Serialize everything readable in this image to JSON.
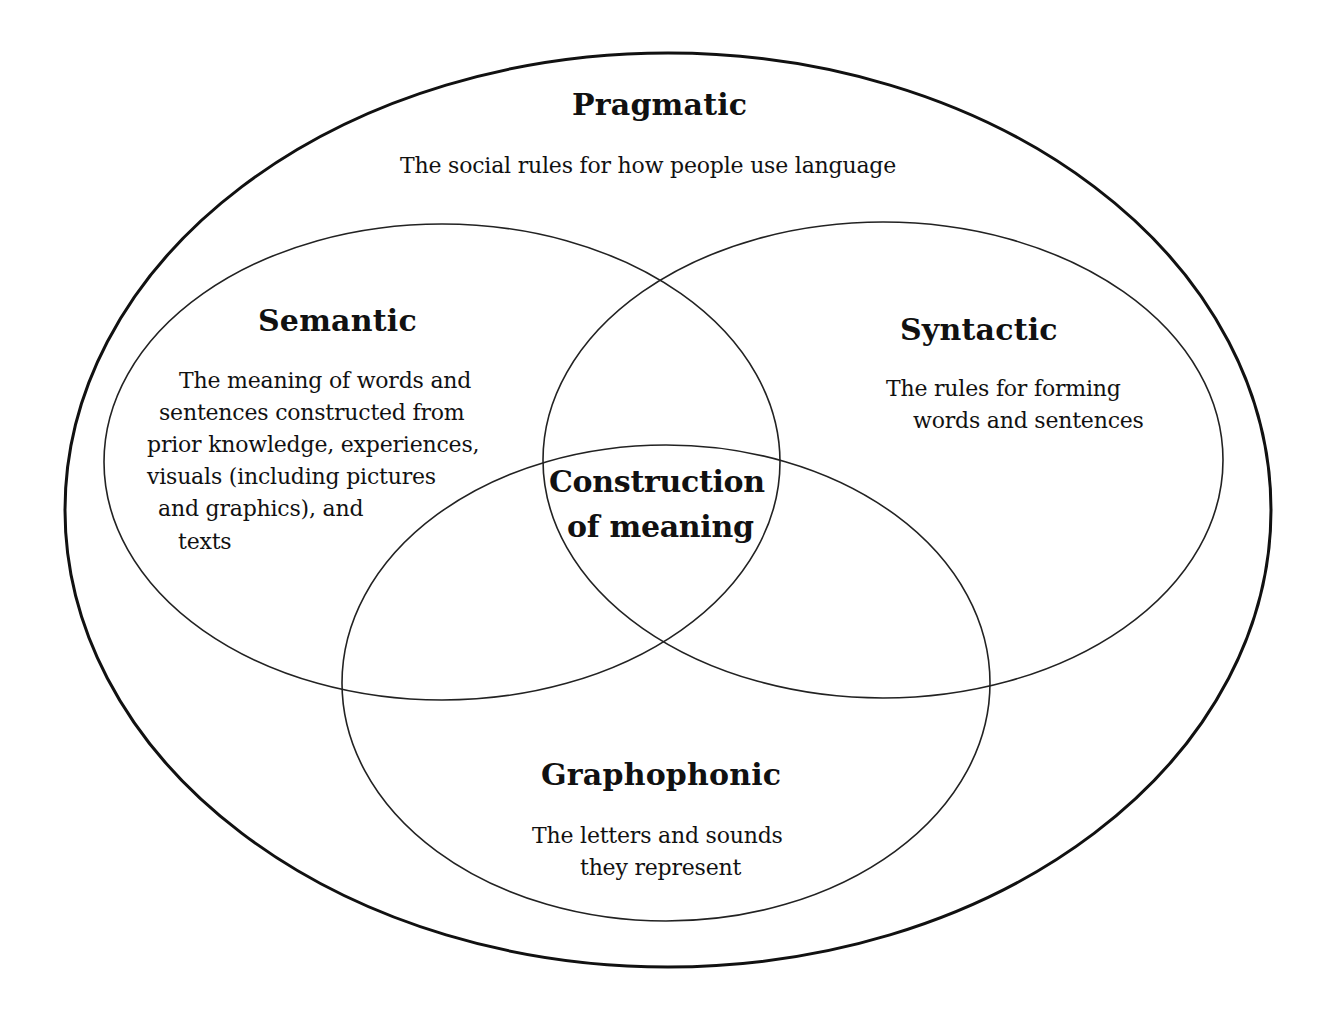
{
  "diagram": {
    "type": "nested-venn",
    "stroke_color": "#111111",
    "background": "#ffffff",
    "outer": {
      "title": "Pragmatic",
      "description": "The social rules for how people use language"
    },
    "circles": [
      {
        "id": "semantic",
        "title": "Semantic",
        "description_lines": [
          "The meaning of words and",
          "sentences constructed from",
          "prior knowledge, experiences,",
          "visuals (including pictures",
          "and graphics), and",
          "texts"
        ]
      },
      {
        "id": "syntactic",
        "title": "Syntactic",
        "description_lines": [
          "The rules for forming",
          "words and sentences"
        ]
      },
      {
        "id": "graphophonic",
        "title": "Graphophonic",
        "description_lines": [
          "The letters and sounds",
          "they represent"
        ]
      }
    ],
    "center": {
      "lines": [
        "Construction",
        "of meaning"
      ]
    }
  }
}
